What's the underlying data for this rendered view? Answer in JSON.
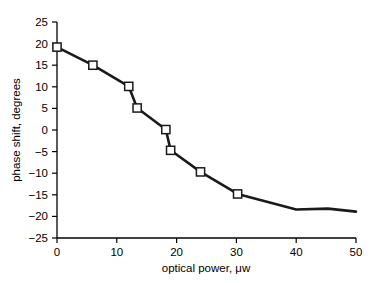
{
  "chart_data": {
    "type": "line",
    "title": "",
    "xlabel": "optical power, μw",
    "ylabel": "phase shift, degrees",
    "xlim": [
      0,
      50
    ],
    "ylim": [
      -25,
      25
    ],
    "xticks": [
      0,
      10,
      20,
      30,
      40,
      50
    ],
    "yticks": [
      -25,
      -20,
      -15,
      -10,
      -5,
      0,
      5,
      10,
      15,
      20,
      25
    ],
    "xtick_labels": [
      "0",
      "10",
      "20",
      "30",
      "40",
      "50"
    ],
    "ytick_labels": [
      "−25",
      "−20",
      "−15",
      "−10",
      "−5",
      "0",
      "5",
      "10",
      "15",
      "20",
      "25"
    ],
    "grid": false,
    "legend": null,
    "series": [
      {
        "name": "phase shift",
        "marker": "open-square",
        "line_color": "#1a1a1a",
        "x": [
          0,
          6.0,
          12.0,
          13.4,
          18.2,
          19.0,
          24.0,
          30.2,
          40.0,
          45.3,
          50.0
        ],
        "y": [
          19.2,
          15.0,
          10.1,
          5.1,
          0.1,
          -4.7,
          -9.7,
          -14.8,
          -18.4,
          -18.2,
          -18.9
        ],
        "marker_indices": [
          0,
          1,
          2,
          3,
          4,
          5,
          6,
          7
        ]
      }
    ]
  },
  "axes": {
    "x_axis_name": "optical-power-axis",
    "y_axis_name": "phase-shift-axis"
  }
}
